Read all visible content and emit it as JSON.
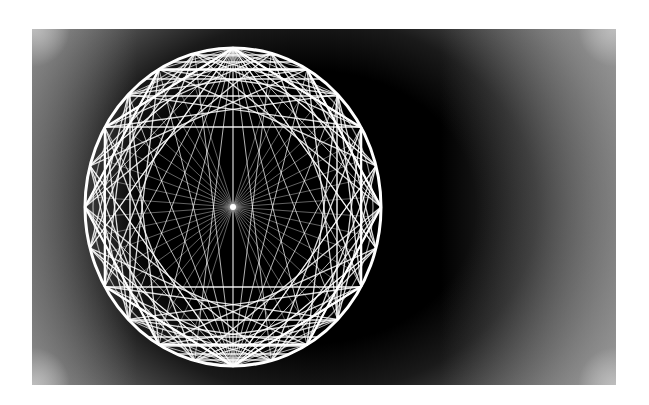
{
  "figure": {
    "type": "geometric-wireframe-sphere",
    "background": {
      "panel_color": "#000000",
      "edge_color": "#9a9a9a",
      "page_color": "#ffffff"
    },
    "stroke_color": "#ffffff",
    "center": [
      233,
      207
    ],
    "radius_x": 148,
    "radius_y": 159,
    "rim_points": 24,
    "chord_skips": [
      4,
      5,
      7
    ],
    "hexagons": [
      {
        "rotation_deg": 90
      },
      {
        "rotation_deg": 0
      }
    ],
    "radial_star": {
      "rays": 48,
      "excluded_sectors_deg": [
        [
          75,
          105
        ],
        [
          255,
          285
        ]
      ]
    },
    "horizontal_lines_y": [
      55,
      62,
      70,
      79,
      96,
      127,
      287,
      320,
      337,
      346,
      354,
      360
    ],
    "vertical_lines_x": [
      130,
      233,
      337
    ]
  }
}
